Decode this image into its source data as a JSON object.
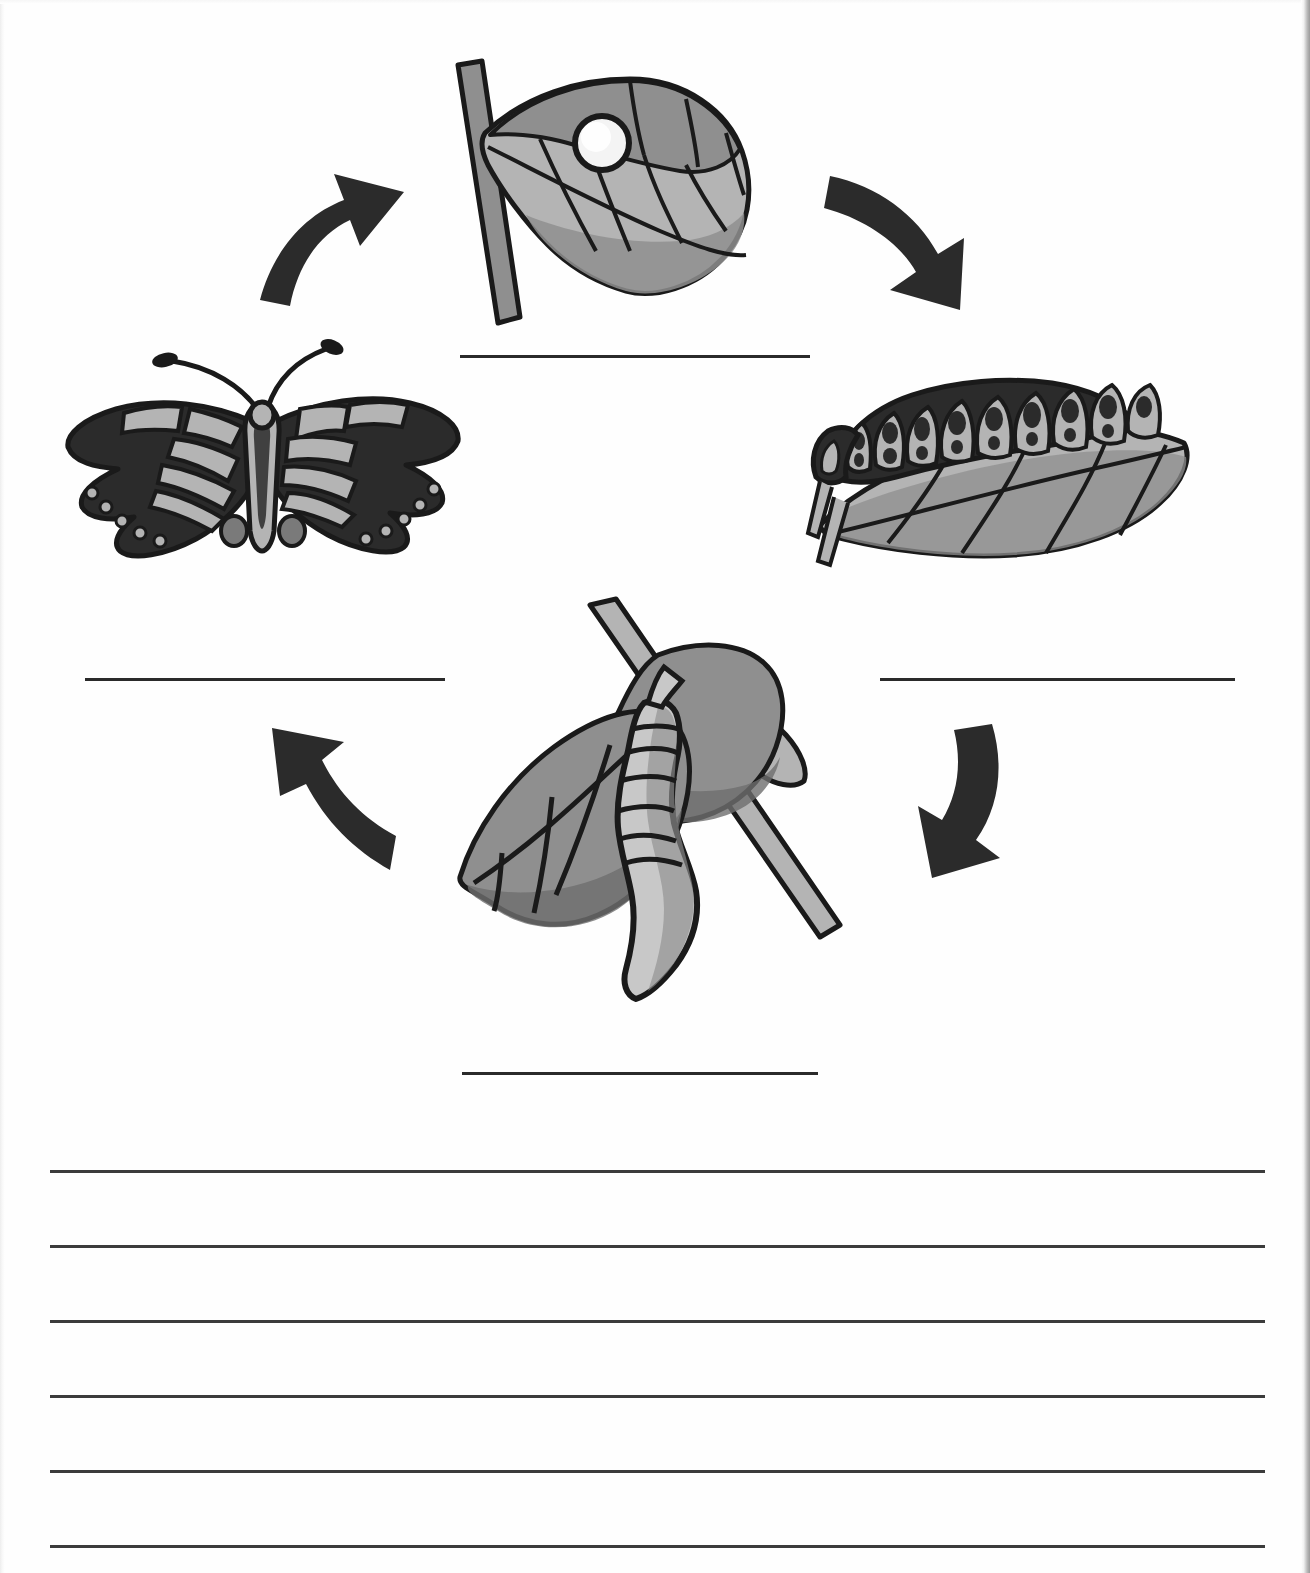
{
  "worksheet": {
    "title": "Butterfly Life Cycle Diagram Worksheet",
    "page_width": 1310,
    "page_height": 1573,
    "background_color": "#fefefe",
    "ink_color": "#1a1a1a"
  },
  "palette": {
    "outline": "#1a1a1a",
    "dark_fill": "#2b2b2b",
    "mid_gray": "#8f8f8f",
    "light_gray": "#b4b4b4",
    "lighter_gray": "#c8c8c8",
    "shadow_gray": "#7a7a7a",
    "egg_white": "#f4f4f4",
    "line_color": "#2a2a2a"
  },
  "diagram": {
    "type": "cycle",
    "caption": "",
    "stages": [
      {
        "id": "egg",
        "icon": "egg-on-leaf-icon",
        "label": "",
        "answer_line_label": "",
        "position": "top-center",
        "description": "White egg on a gray leaf attached to a stem"
      },
      {
        "id": "larva",
        "icon": "caterpillar-on-leaf-icon",
        "label": "",
        "answer_line_label": "",
        "position": "right",
        "description": "Segmented caterpillar resting on a leaf"
      },
      {
        "id": "pupa",
        "icon": "chrysalis-on-branch-icon",
        "label": "",
        "answer_line_label": "",
        "position": "bottom-center",
        "description": "Chrysalis hanging from a branch among leaves"
      },
      {
        "id": "adult",
        "icon": "butterfly-icon",
        "label": "",
        "answer_line_label": "",
        "position": "left",
        "description": "Adult swallowtail butterfly with open wings"
      }
    ],
    "arrows": [
      {
        "id": "arrow-adult-to-egg",
        "icon": "curved-arrow-up-right-icon",
        "from": "adult",
        "to": "egg"
      },
      {
        "id": "arrow-egg-to-larva",
        "icon": "curved-arrow-down-right-icon",
        "from": "egg",
        "to": "larva"
      },
      {
        "id": "arrow-larva-to-pupa",
        "icon": "curved-arrow-down-left-icon",
        "from": "larva",
        "to": "pupa"
      },
      {
        "id": "arrow-pupa-to-adult",
        "icon": "curved-arrow-up-left-icon",
        "from": "pupa",
        "to": "adult"
      }
    ],
    "answer_blanks": [
      {
        "id": "blank-top",
        "value": "",
        "x": 460,
        "y": 355,
        "width": 350
      },
      {
        "id": "blank-right",
        "value": "",
        "x": 880,
        "y": 678,
        "width": 355
      },
      {
        "id": "blank-left",
        "value": "",
        "x": 85,
        "y": 678,
        "width": 360
      },
      {
        "id": "blank-bottom",
        "value": "",
        "x": 462,
        "y": 1072,
        "width": 356
      }
    ]
  },
  "writing_area": {
    "line_count": 6,
    "lines": [
      {
        "id": "write-line-1",
        "value": "",
        "y": 1170
      },
      {
        "id": "write-line-2",
        "value": "",
        "y": 1245
      },
      {
        "id": "write-line-3",
        "value": "",
        "y": 1320
      },
      {
        "id": "write-line-4",
        "value": "",
        "y": 1395
      },
      {
        "id": "write-line-5",
        "value": "",
        "y": 1470
      },
      {
        "id": "write-line-6",
        "value": "",
        "y": 1545
      }
    ],
    "x": 50,
    "width": 1215
  }
}
